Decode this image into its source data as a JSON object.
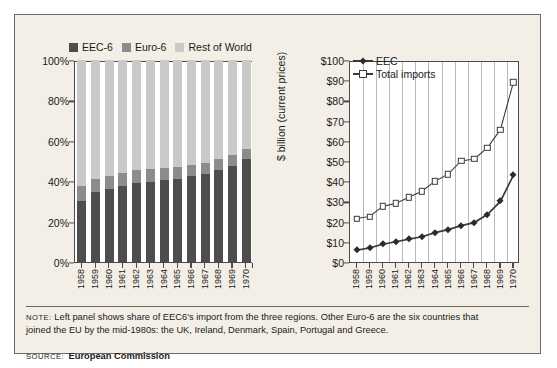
{
  "colors": {
    "eec6": "#4d4d4d",
    "euro6": "#8c8c8c",
    "rest": "#c9c9c9",
    "frame_bg": "#f3efe6",
    "frame_border": "#6f6a60",
    "axis": "#4a4a4a",
    "gridline": "#b9b9b9",
    "line_stroke": "#3a3a3a"
  },
  "footer": {
    "note_kicker": "NOTE:",
    "note_line1": "Left panel shows share of EEC6's import from the three regions. Other Euro-6 are the six countries that",
    "note_line2": "joined the EU by the mid-1980s: the UK, Ireland, Denmark, Spain, Portugal and Greece.",
    "source_kicker": "SOURCE:",
    "source_text": "European Commission"
  },
  "chart_data": [
    {
      "type": "bar",
      "title": "",
      "stacked": true,
      "xlabel": "",
      "ylabel": "",
      "ylim": [
        0,
        100
      ],
      "ytick_labels": [
        "0%",
        "20%",
        "40%",
        "60%",
        "80%",
        "100%"
      ],
      "ytick_values": [
        0,
        20,
        40,
        60,
        80,
        100
      ],
      "grid": false,
      "legend_position": "top",
      "categories": [
        "1958",
        "1959",
        "1960",
        "1961",
        "1962",
        "1963",
        "1964",
        "1965",
        "1966",
        "1967",
        "1968",
        "1969",
        "1970"
      ],
      "series": [
        {
          "name": "EEC-6",
          "color": "#4d4d4d",
          "values": [
            30.0,
            34.5,
            36.0,
            37.5,
            39.0,
            39.5,
            40.5,
            41.0,
            42.5,
            43.5,
            45.5,
            47.5,
            51.0
          ]
        },
        {
          "name": "Euro-6",
          "color": "#8c8c8c",
          "values": [
            7.5,
            6.5,
            6.5,
            6.5,
            6.5,
            6.5,
            6.0,
            6.0,
            5.5,
            5.5,
            5.5,
            5.5,
            5.0
          ]
        },
        {
          "name": "Rest of World",
          "color": "#c9c9c9",
          "values": [
            62.5,
            59.0,
            57.5,
            56.0,
            54.5,
            54.0,
            53.5,
            53.0,
            52.0,
            51.0,
            49.0,
            47.0,
            44.0
          ]
        }
      ]
    },
    {
      "type": "line",
      "title": "",
      "xlabel": "",
      "ylabel": "$ billion (current prices)",
      "ylim": [
        0,
        100
      ],
      "ytick_labels": [
        "$0",
        "$10",
        "$20",
        "$30",
        "$40",
        "$50",
        "$60",
        "$70",
        "$80",
        "$90",
        "$100"
      ],
      "ytick_values": [
        0,
        10,
        20,
        30,
        40,
        50,
        60,
        70,
        80,
        90,
        100
      ],
      "grid": "vertical",
      "legend_position": "top-left-inside",
      "x": [
        "1958",
        "1959",
        "1960",
        "1961",
        "1962",
        "1963",
        "1964",
        "1965",
        "1966",
        "1967",
        "1968",
        "1969",
        "1970"
      ],
      "series": [
        {
          "name": "EEC",
          "marker": "filled-diamond",
          "values": [
            6.8,
            8.0,
            9.8,
            11.0,
            12.3,
            13.5,
            15.5,
            17.0,
            19.0,
            20.5,
            24.5,
            31.0,
            44.0
          ]
        },
        {
          "name": "Total imports",
          "marker": "open-square",
          "values": [
            22.5,
            23.5,
            28.5,
            30.0,
            33.0,
            36.0,
            41.0,
            44.5,
            51.0,
            52.0,
            57.5,
            66.5,
            90.0
          ]
        }
      ]
    }
  ]
}
